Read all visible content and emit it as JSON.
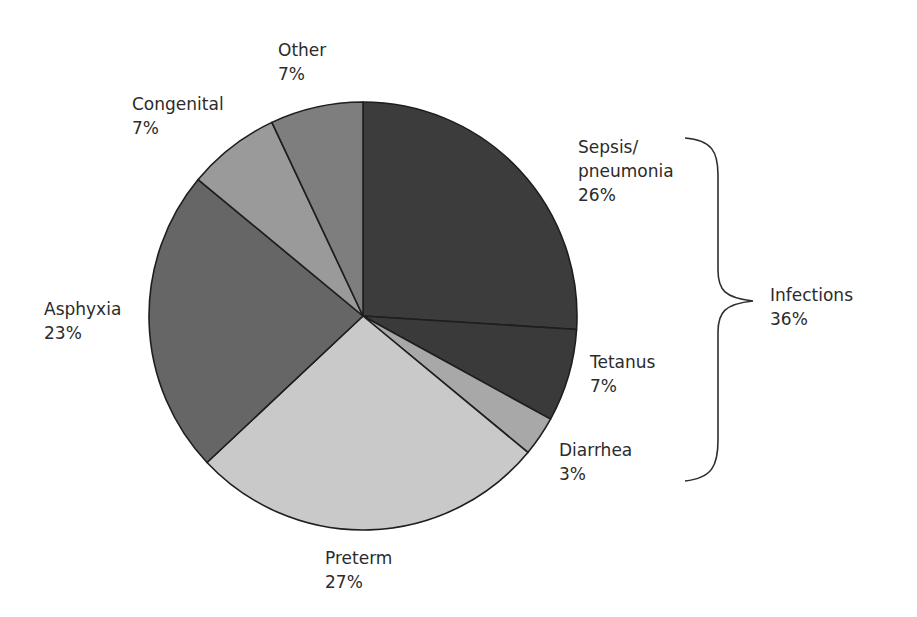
{
  "chart_data": {
    "type": "pie",
    "title": "",
    "start_angle_deg": 0,
    "direction": "clockwise",
    "slices": [
      {
        "label": "Sepsis/ pneumonia",
        "value": 26,
        "display": "26%",
        "color": "#3c3c3c"
      },
      {
        "label": "Tetanus",
        "value": 7,
        "display": "7%",
        "color": "#3a3a3a"
      },
      {
        "label": "Diarrhea",
        "value": 3,
        "display": "3%",
        "color": "#a8a8a8"
      },
      {
        "label": "Preterm",
        "value": 27,
        "display": "27%",
        "color": "#c9c9c9"
      },
      {
        "label": "Asphyxia",
        "value": 23,
        "display": "23%",
        "color": "#666666"
      },
      {
        "label": "Congenital",
        "value": 7,
        "display": "7%",
        "color": "#9a9a9a"
      },
      {
        "label": "Other",
        "value": 7,
        "display": "7%",
        "color": "#7e7e7e"
      }
    ],
    "group_annotations": [
      {
        "label": "Infections",
        "display": "36%",
        "members": [
          "Sepsis/ pneumonia",
          "Tetanus",
          "Diarrhea"
        ]
      }
    ]
  },
  "labels": {
    "sepsis": {
      "line1": "Sepsis/",
      "line2": "pneumonia",
      "pct": "26%"
    },
    "tetanus": {
      "line1": "Tetanus",
      "pct": "7%"
    },
    "diarrhea": {
      "line1": "Diarrhea",
      "pct": "3%"
    },
    "preterm": {
      "line1": "Preterm",
      "pct": "27%"
    },
    "asphyxia": {
      "line1": "Asphyxia",
      "pct": "23%"
    },
    "congenital": {
      "line1": "Congenital",
      "pct": "7%"
    },
    "other": {
      "line1": "Other",
      "pct": "7%"
    },
    "infections": {
      "line1": "Infections",
      "pct": "36%"
    }
  }
}
